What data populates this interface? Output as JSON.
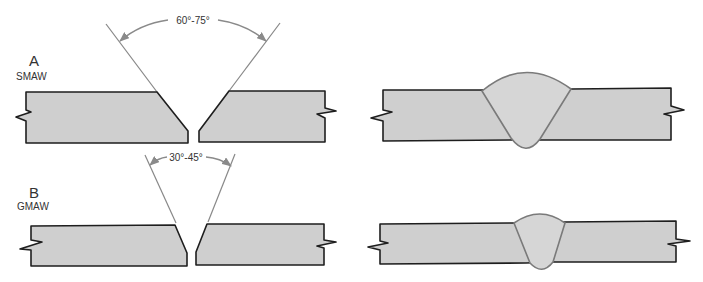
{
  "diagram": {
    "rows": [
      {
        "letter": "A",
        "process": "SMAW",
        "angle_label": "60°-75°",
        "prepared": {
          "groove": "V-groove"
        },
        "welded": {
          "weld": "full penetration bead"
        }
      },
      {
        "letter": "B",
        "process": "GMAW",
        "angle_label": "30°-45°",
        "prepared": {
          "groove": "V-groove"
        },
        "welded": {
          "weld": "full penetration bead"
        }
      }
    ],
    "colors": {
      "plate_fill": "#cfcfcf",
      "plate_stroke": "#1e1e1e",
      "weld_fill": "#d6d6d6",
      "weld_stroke": "#7a7a7a",
      "guide_line": "#888888",
      "arrow": "#8a8a8a"
    }
  }
}
